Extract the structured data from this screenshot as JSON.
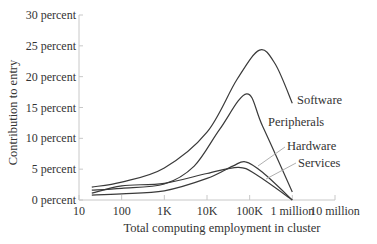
{
  "chart_data": {
    "type": "line",
    "title": "",
    "xlabel": "Total computing employment in cluster",
    "ylabel": "Contribution to entry",
    "x_scale": "log",
    "xlim": [
      10,
      10000000
    ],
    "ylim": [
      0,
      30
    ],
    "x_ticks": [
      {
        "value": 10,
        "label": "10"
      },
      {
        "value": 100,
        "label": "100"
      },
      {
        "value": 1000,
        "label": "1K"
      },
      {
        "value": 10000,
        "label": "10K"
      },
      {
        "value": 100000,
        "label": "100K"
      },
      {
        "value": 1000000,
        "label": "1 million"
      },
      {
        "value": 10000000,
        "label": "10 million"
      }
    ],
    "y_ticks": [
      {
        "value": 0,
        "label": "0 percent"
      },
      {
        "value": 5,
        "label": "5 percent"
      },
      {
        "value": 10,
        "label": "10 percent"
      },
      {
        "value": 15,
        "label": "15 percent"
      },
      {
        "value": 20,
        "label": "20 percent"
      },
      {
        "value": 25,
        "label": "25 percent"
      },
      {
        "value": 30,
        "label": "30 percent"
      }
    ],
    "grid": false,
    "legend": "inline-labels-right",
    "series": [
      {
        "name": "Software",
        "label": "Software",
        "points": [
          [
            20,
            2.1
          ],
          [
            100,
            2.9
          ],
          [
            1000,
            5.2
          ],
          [
            10000,
            11.0
          ],
          [
            50000,
            19.5
          ],
          [
            170000,
            24.3
          ],
          [
            400000,
            22.0
          ],
          [
            1000000,
            15.7
          ]
        ]
      },
      {
        "name": "Peripherals",
        "label": "Peripherals",
        "points": [
          [
            20,
            1.6
          ],
          [
            100,
            1.9
          ],
          [
            1000,
            2.6
          ],
          [
            5000,
            5.5
          ],
          [
            20000,
            11.5
          ],
          [
            85000,
            17.2
          ],
          [
            200000,
            12.0
          ],
          [
            1000000,
            1.3
          ]
        ]
      },
      {
        "name": "Hardware",
        "label": "Hardware",
        "points": [
          [
            20,
            0.8
          ],
          [
            100,
            1.0
          ],
          [
            1000,
            1.5
          ],
          [
            10000,
            3.5
          ],
          [
            40000,
            5.5
          ],
          [
            80000,
            6.2
          ],
          [
            200000,
            4.5
          ],
          [
            1000000,
            0
          ]
        ]
      },
      {
        "name": "Services",
        "label": "Services",
        "points": [
          [
            20,
            1.1
          ],
          [
            100,
            2.3
          ],
          [
            1000,
            2.7
          ],
          [
            10000,
            4.3
          ],
          [
            55000,
            5.3
          ],
          [
            150000,
            4.0
          ],
          [
            1000000,
            0
          ]
        ]
      }
    ]
  }
}
